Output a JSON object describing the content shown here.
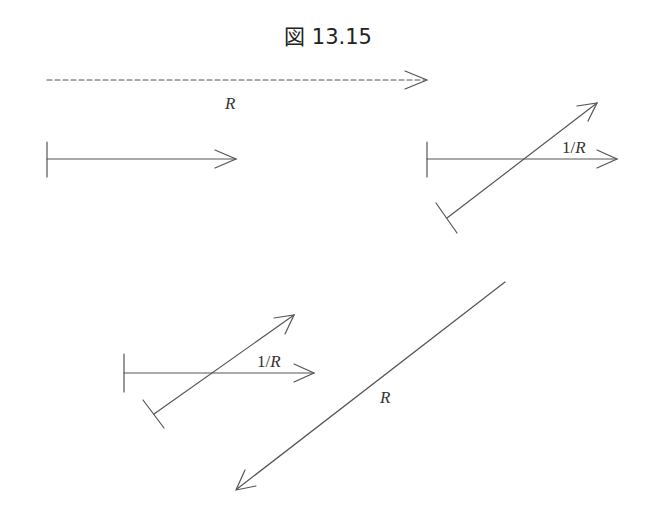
{
  "figure": {
    "title": "図 13.15"
  },
  "colors": {
    "line": "#555555",
    "text": "#222222",
    "background": "#ffffff"
  },
  "labels": {
    "dashed_arrow": "R",
    "top_right_group": {
      "num": "1/",
      "var": "R"
    },
    "bottom_left_group": {
      "num": "1/",
      "var": "R"
    },
    "long_arrow": "R"
  },
  "elements": [
    {
      "id": "dashed-arrow",
      "type": "dashed-arrow",
      "from": [
        47,
        80
      ],
      "to": [
        427,
        80
      ],
      "label": "R"
    },
    {
      "id": "reference-vector",
      "type": "arrow-with-tail-tick",
      "from": [
        47,
        159
      ],
      "to": [
        236,
        159
      ]
    },
    {
      "id": "top-right-horizontal",
      "type": "arrow-with-tail-tick",
      "from": [
        427,
        159
      ],
      "to": [
        617,
        159
      ],
      "label": "1/R"
    },
    {
      "id": "top-right-diagonal",
      "type": "arrow-with-tail-tick",
      "from": [
        447,
        218
      ],
      "to": [
        597,
        103
      ]
    },
    {
      "id": "bottom-left-horizontal",
      "type": "arrow-with-tail-tick",
      "from": [
        124,
        373
      ],
      "to": [
        314,
        373
      ],
      "label": "1/R"
    },
    {
      "id": "bottom-left-diagonal",
      "type": "arrow-with-tail-tick",
      "from": [
        154,
        414
      ],
      "to": [
        294,
        315
      ]
    },
    {
      "id": "long-diagonal",
      "type": "arrow",
      "from": [
        505,
        282
      ],
      "to": [
        236,
        490
      ],
      "label": "R"
    }
  ]
}
